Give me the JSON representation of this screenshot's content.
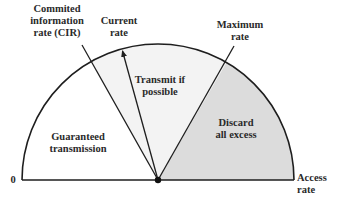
{
  "diagram": {
    "type": "gauge-semicircle",
    "colors": {
      "stroke": "#1e1e1e",
      "transmit_region": "#f3f3f3",
      "discard_region": "#dcdcdc",
      "guaranteed_region": "#ffffff"
    },
    "geometry": {
      "center": [
        158,
        180
      ],
      "radius": 136
    },
    "markers": {
      "cir": {
        "lines": [
          "Commited",
          "information",
          "rate (CIR)"
        ]
      },
      "current": {
        "lines": [
          "Current",
          "rate"
        ]
      },
      "maximum": {
        "lines": [
          "Maximum",
          "rate"
        ]
      }
    },
    "regions": {
      "guaranteed": {
        "lines": [
          "Guaranteed",
          "transmission"
        ]
      },
      "transmit": {
        "lines": [
          "Transmit if",
          "possible"
        ]
      },
      "discard": {
        "lines": [
          "Discard",
          "all excess"
        ]
      }
    },
    "axis": {
      "zero_label": "0",
      "end_label_lines": [
        "Access",
        "rate"
      ]
    }
  }
}
